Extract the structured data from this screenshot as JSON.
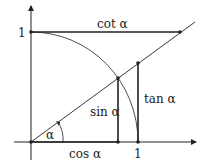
{
  "diagram": {
    "labels": {
      "cot": "cot α",
      "sin": "sin α",
      "tan": "tan α",
      "cos": "cos α",
      "alpha": "α",
      "y_unit": "1",
      "x_unit": "1"
    },
    "colors": {
      "stroke": "#222222",
      "background": "#ffffff"
    }
  }
}
